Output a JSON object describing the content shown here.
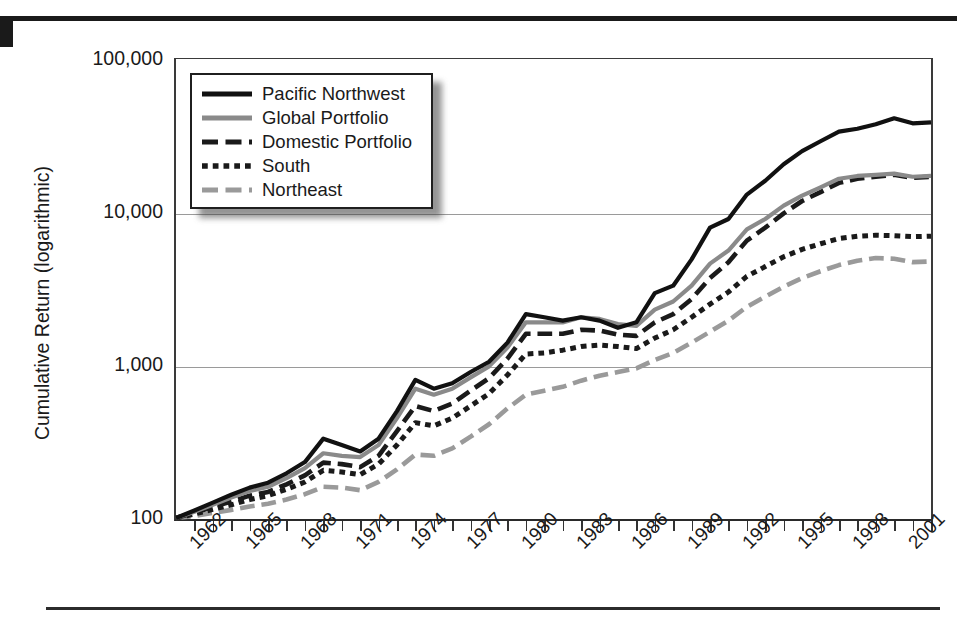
{
  "chart_data": {
    "type": "line",
    "title": "",
    "xlabel": "",
    "ylabel": "Cumulative Return (logarithmic)",
    "yscale": "log",
    "ylim": [
      100,
      100000
    ],
    "ytick_labels": [
      "100,000",
      "10,000",
      "1,000",
      "100"
    ],
    "ytick_values": [
      100000,
      10000,
      1000,
      100
    ],
    "grid": "horizontal",
    "legend_position": "top-left-inside",
    "xlim": [
      1961,
      2002
    ],
    "xtick_labels": [
      "1962",
      "1965",
      "1968",
      "1971",
      "1974",
      "1977",
      "1980",
      "1983",
      "1986",
      "1989",
      "1992",
      "1995",
      "1998",
      "2001"
    ],
    "xtick_values": [
      1962,
      1965,
      1968,
      1971,
      1974,
      1977,
      1980,
      1983,
      1986,
      1989,
      1992,
      1995,
      1998,
      2001
    ],
    "x": [
      1961,
      1962,
      1963,
      1964,
      1965,
      1966,
      1967,
      1968,
      1969,
      1970,
      1971,
      1972,
      1973,
      1974,
      1975,
      1976,
      1977,
      1978,
      1979,
      1980,
      1981,
      1982,
      1983,
      1984,
      1985,
      1986,
      1987,
      1988,
      1989,
      1990,
      1991,
      1992,
      1993,
      1994,
      1995,
      1996,
      1997,
      1998,
      1999,
      2000,
      2001,
      2002
    ],
    "series": [
      {
        "name": "Pacific Northwest",
        "color": "#111111",
        "style": "solid",
        "width": 4.2,
        "values": [
          100,
          112,
          126,
          142,
          158,
          170,
          196,
          232,
          330,
          300,
          272,
          330,
          500,
          800,
          700,
          760,
          900,
          1050,
          1400,
          2150,
          2050,
          1950,
          2050,
          1950,
          1750,
          1900,
          2950,
          3300,
          4900,
          7900,
          9000,
          13000,
          16000,
          20500,
          25000,
          29000,
          33500,
          35000,
          37500,
          41000,
          38000,
          38500
        ]
      },
      {
        "name": "Global Portfolio",
        "color": "#8a8a8a",
        "style": "solid",
        "width": 4.2,
        "values": [
          100,
          110,
          122,
          136,
          150,
          160,
          182,
          212,
          265,
          255,
          250,
          300,
          450,
          700,
          640,
          700,
          830,
          980,
          1300,
          1900,
          1900,
          1900,
          2050,
          2000,
          1850,
          1800,
          2300,
          2600,
          3300,
          4600,
          5600,
          7700,
          9000,
          11000,
          12800,
          14500,
          16500,
          17200,
          17500,
          17800,
          17000,
          17200
        ]
      },
      {
        "name": "Domestic Portfolio",
        "color": "#1a1a1a",
        "style": "dashed",
        "width": 4.6,
        "values": [
          100,
          108,
          118,
          128,
          140,
          148,
          166,
          190,
          230,
          225,
          215,
          255,
          370,
          540,
          500,
          560,
          680,
          820,
          1100,
          1600,
          1600,
          1600,
          1700,
          1680,
          1580,
          1550,
          1900,
          2150,
          2700,
          3700,
          4700,
          6500,
          7900,
          9800,
          11800,
          13500,
          15500,
          16500,
          17000,
          17500,
          16700,
          17000
        ]
      },
      {
        "name": "South",
        "color": "#1a1a1a",
        "style": "dotted",
        "width": 5.0,
        "values": [
          100,
          106,
          114,
          122,
          132,
          140,
          154,
          172,
          205,
          200,
          192,
          225,
          300,
          420,
          400,
          450,
          540,
          650,
          860,
          1180,
          1200,
          1250,
          1320,
          1350,
          1320,
          1280,
          1500,
          1700,
          2050,
          2500,
          3000,
          3800,
          4400,
          5100,
          5700,
          6200,
          6700,
          6950,
          7050,
          7000,
          6900,
          6950
        ]
      },
      {
        "name": "Northeast",
        "color": "#9a9a9a",
        "style": "dashed",
        "width": 4.6,
        "values": [
          100,
          103,
          108,
          113,
          119,
          124,
          132,
          143,
          160,
          158,
          152,
          172,
          208,
          260,
          255,
          285,
          340,
          410,
          520,
          640,
          680,
          720,
          790,
          850,
          900,
          950,
          1080,
          1200,
          1400,
          1650,
          1950,
          2400,
          2800,
          3250,
          3700,
          4100,
          4500,
          4800,
          5000,
          4950,
          4700,
          4750
        ]
      }
    ]
  }
}
